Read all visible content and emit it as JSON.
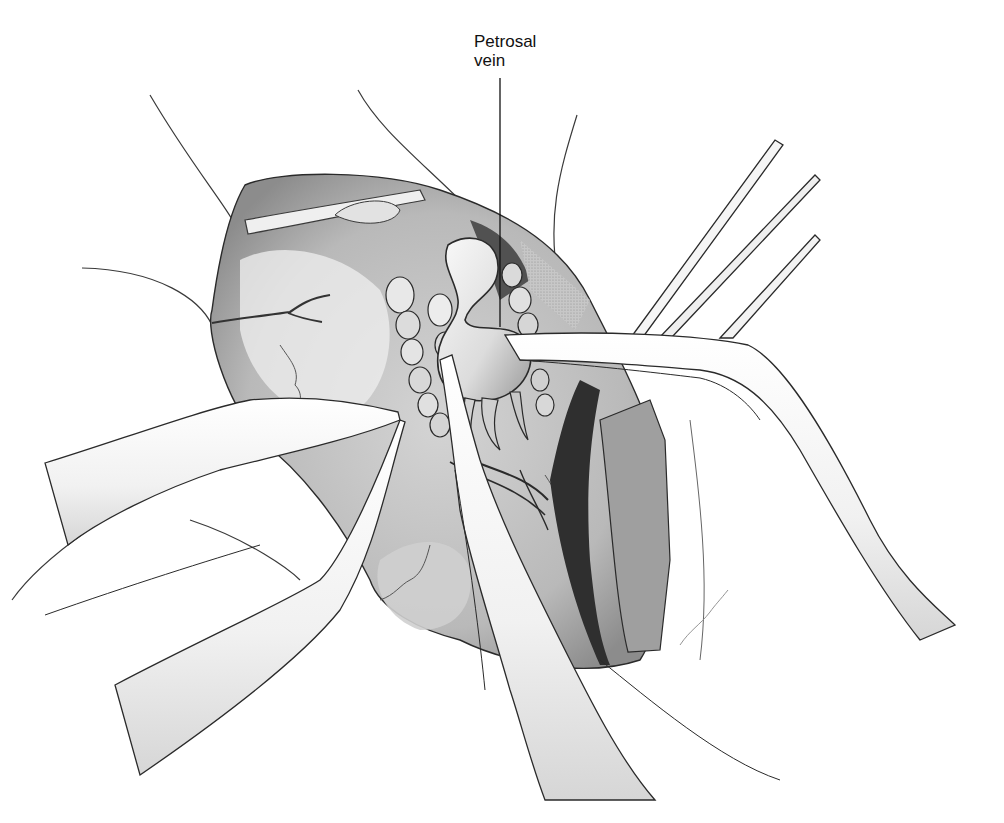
{
  "figure": {
    "type": "surgical anatomical illustration",
    "style": "grayscale pencil drawing",
    "colors": {
      "background": "#ffffff",
      "ink": "#1a1a1a",
      "shade_light": "#d9d9d9",
      "shade_mid": "#a8a8a8",
      "shade_dark": "#555555",
      "deep_cavity": "#2a2a2a"
    }
  },
  "labels": [
    {
      "id": "petrosal-vein",
      "lines": [
        "Petrosal",
        "vein"
      ],
      "position": {
        "x": 474,
        "y": 32
      },
      "leader_line": {
        "x1": 500,
        "y1": 78,
        "x2": 500,
        "y2": 327
      }
    }
  ],
  "instruments": [
    {
      "name": "left-retractor-upper",
      "direction": "from left"
    },
    {
      "name": "left-retractor-lower",
      "direction": "from lower left"
    },
    {
      "name": "center-instrument",
      "direction": "from bottom"
    },
    {
      "name": "right-instrument",
      "direction": "from right"
    },
    {
      "name": "upper-right-instruments",
      "count": 3
    }
  ]
}
